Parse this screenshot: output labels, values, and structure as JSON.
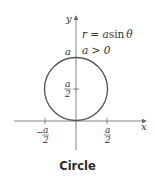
{
  "figure": {
    "caption": "Circle",
    "equation": "r = a sin θ",
    "equation_parts": {
      "lhs": "r = ",
      "a": "a",
      "sin": "sin",
      "theta": "θ"
    },
    "condition": "a > 0",
    "axis_labels": {
      "x": "x",
      "y": "y"
    },
    "tick_labels": {
      "y_top": "a",
      "y_half_num": "a",
      "y_half_den": "2",
      "x_neg_sign": "−",
      "x_neg_num": "a",
      "x_neg_den": "2",
      "x_pos_num": "a",
      "x_pos_den": "2"
    },
    "colors": {
      "curve": "#555555",
      "axis": "#666666",
      "text": "#333333"
    }
  }
}
